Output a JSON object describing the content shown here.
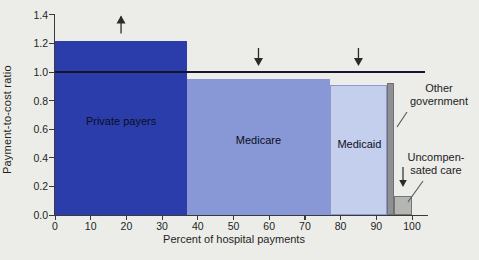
{
  "chart_data": {
    "type": "bar",
    "variant": "variable-width-segment-bars",
    "title": "",
    "xlabel": "Percent of hospital payments",
    "ylabel": "Payment-to-cost ratio",
    "xlim": [
      0,
      100
    ],
    "ylim": [
      0.0,
      1.4
    ],
    "x_ticks": [
      0,
      10,
      20,
      30,
      40,
      50,
      60,
      70,
      80,
      90,
      100
    ],
    "y_ticks": [
      0.0,
      0.2,
      0.4,
      0.6,
      0.8,
      1.0,
      1.2,
      1.4
    ],
    "grid": "off",
    "legend": "none",
    "reference_line": 1.0,
    "segments": [
      {
        "label": "Private payers",
        "x_start": 0,
        "x_end": 37,
        "ratio": 1.22,
        "trend": "up",
        "color": "#2a3dab",
        "border": "",
        "label_inside": true
      },
      {
        "label": "Medicare",
        "x_start": 37,
        "x_end": 77,
        "ratio": 0.95,
        "trend": "down",
        "color": "#8897d6",
        "border": "",
        "label_inside": true
      },
      {
        "label": "Medicaid",
        "x_start": 77,
        "x_end": 93,
        "ratio": 0.91,
        "trend": "down",
        "color": "#c4cfed",
        "border": "#8d99cc",
        "label_inside": true
      },
      {
        "label": "Other government",
        "x_start": 93,
        "x_end": 95,
        "ratio": 0.92,
        "trend": "",
        "color": "#8f9093",
        "border": "#6f7073",
        "label_inside": false
      },
      {
        "label": "Uncompensated care",
        "x_start": 95,
        "x_end": 100,
        "ratio": 0.13,
        "trend": "",
        "color": "#b4b6b4",
        "border": "#747674",
        "label_inside": false
      }
    ],
    "colors": {
      "background": "#ecede9",
      "axis": "#3a3a3a",
      "reference_line": "#15162b",
      "arrow": "#2a2a2a",
      "pointer_line": "#555555"
    }
  },
  "annotations": {
    "other_government": {
      "line1": "Other",
      "line2": "government"
    },
    "uncompensated": {
      "line1": "Uncompen-",
      "line2": "sated care"
    }
  }
}
